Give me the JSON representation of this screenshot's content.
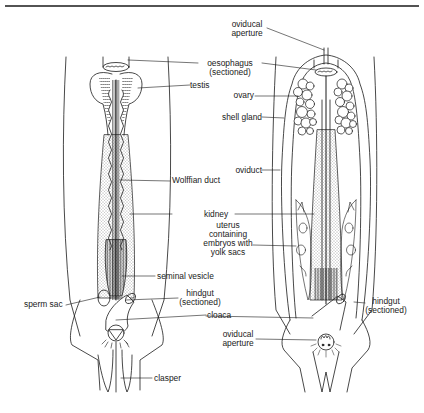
{
  "figure": {
    "left_specimen": "male",
    "right_specimen": "female",
    "stroke_color": "#1a1a1a",
    "background": "#ffffff"
  },
  "labels": {
    "oviducal_aperture_top_1": "oviducal",
    "oviducal_aperture_top_2": "aperture",
    "oesophagus_1": "oesophagus",
    "oesophagus_2": "(sectioned)",
    "testis": "testis",
    "ovary": "ovary",
    "shell_gland": "shell gland",
    "oviduct": "oviduct",
    "wolffian_duct": "Wolffian duct",
    "kidney": "kidney",
    "uterus_1": "uterus",
    "uterus_2": "containing",
    "uterus_3": "embryos with",
    "uterus_4": "yolk sacs",
    "seminal_vesicle": "seminal vesicle",
    "hindgut_left_1": "hindgut",
    "hindgut_left_2": "(sectioned)",
    "sperm_sac": "sperm sac",
    "cloaca": "cloaca",
    "oviducal_aperture_bottom_1": "oviducal",
    "oviducal_aperture_bottom_2": "aperture",
    "hindgut_right_1": "hindgut",
    "hindgut_right_2": "(sectioned)",
    "clasper": "clasper"
  }
}
